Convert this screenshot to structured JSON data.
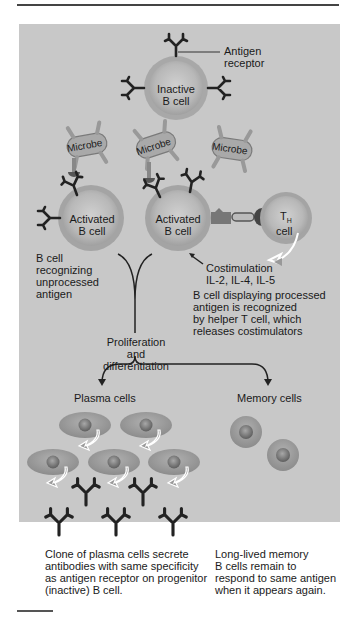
{
  "figure": {
    "labels": {
      "antigen_receptor": "Antigen\nreceptor",
      "inactive_b_cell": "Inactive\nB cell",
      "microbe_1": "Microbe",
      "microbe_2": "Microbe",
      "microbe_3": "Microbe",
      "activated_b_cell_1": "Activated\nB cell",
      "activated_b_cell_2": "Activated\nB cell",
      "th_cell_main": "T",
      "th_cell_sub": "H",
      "th_cell_word": "cell",
      "b_cell_recognizing": "B cell\nrecognizing\nunprocessed\nantigen",
      "costimulation": "Costimulation\nIL-2, IL-4, IL-5",
      "b_cell_displaying": "B cell displaying processed\nantigen is recognized\nby helper T cell, which\nreleases costimulators",
      "proliferation": "Proliferation and\ndifferentiation",
      "plasma_cells": "Plasma cells",
      "memory_cells": "Memory cells",
      "plasma_caption": "Clone of plasma cells secrete\nantibodies with same specificity\nas antigen receptor on progenitor\n(inactive) B cell.",
      "memory_caption": "Long-lived memory\nB cells remain to\nrespond to same antigen\nwhen it appears again."
    },
    "colors": {
      "panel": "#c8c8c8",
      "cell_fill": "#b4b4b4",
      "cell_ring": "#9a9a9a",
      "antibody": "#222222",
      "microbe": "#a8a8a8",
      "nucleus": "#7a7a7a"
    }
  }
}
